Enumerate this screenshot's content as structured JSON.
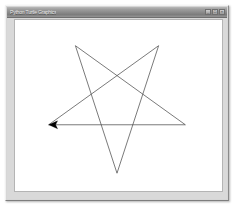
{
  "window": {
    "title": "Python Turtle Graphics",
    "controls": [
      {
        "name": "minimize-button",
        "glyph": "_"
      },
      {
        "name": "maximize-button",
        "glyph": "□"
      },
      {
        "name": "close-button",
        "glyph": "×"
      }
    ]
  },
  "canvas": {
    "background_color": "#ffffff",
    "border_color": "#b4b4b4",
    "width": 209,
    "height": 173,
    "drawing": {
      "shape": "five-pointed-star",
      "name": "pentagram",
      "pen_color": "#4a4a4a",
      "pen_width": 0.75,
      "fill": "none",
      "points": "34,106 172,106 61,26 103,155 145,26 34,106",
      "vertices": [
        {
          "label": "start-left",
          "x": 34,
          "y": 106
        },
        {
          "label": "right",
          "x": 172,
          "y": 106
        },
        {
          "label": "top-left",
          "x": 61,
          "y": 26
        },
        {
          "label": "bottom",
          "x": 103,
          "y": 155
        },
        {
          "label": "top-right",
          "x": 145,
          "y": 26
        }
      ]
    },
    "turtle": {
      "name": "turtle-cursor",
      "shape": "arrow",
      "color": "#000000",
      "x": 34,
      "y": 106,
      "heading_degrees": 180,
      "points": "34,106 43,102 41,106 43,110"
    }
  }
}
